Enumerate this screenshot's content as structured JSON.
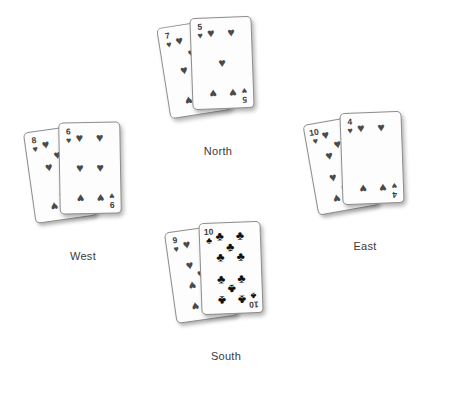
{
  "scene": {
    "background_color": "#ffffff",
    "pip_color": "#4a4a4a",
    "club_color": "#111111",
    "label_color": "#3a3a3a"
  },
  "suits": {
    "hearts": {
      "name": "hearts",
      "glyph": "♥",
      "color": "#4a4a4a"
    },
    "clubs": {
      "name": "clubs",
      "glyph": "♣",
      "color": "#111111"
    }
  },
  "hands": [
    {
      "position": "north",
      "label": "North",
      "cards": [
        {
          "rank": "7",
          "suit": "hearts",
          "suit_glyph": "♥",
          "corner_top_left": "7",
          "corner_bottom_right": "7"
        },
        {
          "rank": "5",
          "suit": "hearts",
          "suit_glyph": "♥",
          "corner_top_left": "5",
          "corner_bottom_right": "5"
        }
      ]
    },
    {
      "position": "west",
      "label": "West",
      "cards": [
        {
          "rank": "8",
          "suit": "hearts",
          "suit_glyph": "♥",
          "corner_top_left": "8",
          "corner_bottom_right": "8"
        },
        {
          "rank": "6",
          "suit": "hearts",
          "suit_glyph": "♥",
          "corner_top_left": "6",
          "corner_bottom_right": "9"
        }
      ]
    },
    {
      "position": "east",
      "label": "East",
      "cards": [
        {
          "rank": "10",
          "suit": "hearts",
          "suit_glyph": "♥",
          "corner_top_left": "10",
          "corner_bottom_right": "10"
        },
        {
          "rank": "4",
          "suit": "hearts",
          "suit_glyph": "♥",
          "corner_top_left": "4",
          "corner_bottom_right": "4"
        }
      ]
    },
    {
      "position": "south",
      "label": "South",
      "cards": [
        {
          "rank": "9",
          "suit": "hearts",
          "suit_glyph": "♥",
          "corner_top_left": "9",
          "corner_bottom_right": "9"
        },
        {
          "rank": "10",
          "suit": "clubs",
          "suit_glyph": "♣",
          "corner_top_left": "10",
          "corner_bottom_right": "10"
        }
      ]
    }
  ]
}
